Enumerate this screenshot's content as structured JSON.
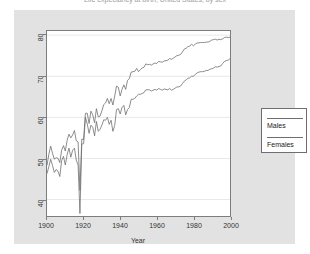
{
  "chart_title": "Life expectancy at birth, United States, by sex",
  "axes": {
    "x_label": "Year",
    "y_label": "",
    "x_ticks": [
      "1900",
      "1920",
      "1940",
      "1960",
      "1980",
      "2000"
    ],
    "y_ticks": [
      "40",
      "50",
      "60",
      "70",
      "80"
    ],
    "xlim": [
      1900,
      2000
    ],
    "ylim": [
      36,
      81
    ]
  },
  "legend": {
    "position": "right",
    "entries": [
      {
        "label": "Females",
        "color": "#6e6e6e"
      },
      {
        "label": "Males",
        "color": "#6e6e6e"
      }
    ],
    "items_top_to_bottom": [
      "Males",
      "Females"
    ]
  },
  "colors": {
    "panel_background": "#e2e2e2",
    "plot_background": "#ffffff",
    "grid": "#e8e8e8",
    "axis": "#7d7d7d",
    "line_female": "#6e6e6e",
    "line_male": "#6e6e6e",
    "text": "#333333"
  },
  "chart_data": {
    "type": "line",
    "title": "Life expectancy at birth, United States, by sex",
    "xlabel": "Year",
    "ylabel": "",
    "xlim": [
      1900,
      2000
    ],
    "ylim": [
      36,
      81
    ],
    "grid": true,
    "legend_position": "right",
    "x": [
      1900,
      1901,
      1902,
      1903,
      1904,
      1905,
      1906,
      1907,
      1908,
      1909,
      1910,
      1911,
      1912,
      1913,
      1914,
      1915,
      1916,
      1917,
      1918,
      1919,
      1920,
      1921,
      1922,
      1923,
      1924,
      1925,
      1926,
      1927,
      1928,
      1929,
      1930,
      1931,
      1932,
      1933,
      1934,
      1935,
      1936,
      1937,
      1938,
      1939,
      1940,
      1941,
      1942,
      1943,
      1944,
      1945,
      1946,
      1947,
      1948,
      1949,
      1950,
      1951,
      1952,
      1953,
      1954,
      1955,
      1956,
      1957,
      1958,
      1959,
      1960,
      1961,
      1962,
      1963,
      1964,
      1965,
      1966,
      1967,
      1968,
      1969,
      1970,
      1971,
      1972,
      1973,
      1974,
      1975,
      1976,
      1977,
      1978,
      1979,
      1980,
      1981,
      1982,
      1983,
      1984,
      1985,
      1986,
      1987,
      1988,
      1989,
      1990,
      1991,
      1992,
      1993,
      1994,
      1995,
      1996,
      1997,
      1998,
      1999,
      2000
    ],
    "series": [
      {
        "name": "Females",
        "values": [
          48.3,
          51.0,
          53.0,
          51.3,
          49.8,
          50.2,
          50.0,
          49.0,
          52.0,
          53.1,
          51.8,
          54.4,
          55.9,
          55.0,
          55.7,
          56.8,
          54.3,
          54.0,
          42.2,
          54.7,
          54.6,
          61.0,
          61.0,
          58.5,
          61.5,
          60.6,
          58.7,
          62.1,
          60.1,
          60.3,
          61.6,
          63.1,
          63.5,
          64.6,
          63.3,
          64.6,
          63.0,
          65.2,
          67.6,
          67.3,
          65.2,
          66.8,
          67.9,
          66.8,
          69.0,
          69.4,
          71.0,
          71.1,
          71.2,
          71.9,
          71.1,
          71.6,
          72.0,
          72.2,
          73.0,
          72.8,
          72.9,
          72.7,
          73.0,
          73.2,
          73.1,
          73.6,
          73.5,
          73.4,
          73.7,
          73.8,
          73.9,
          74.3,
          74.1,
          74.4,
          74.7,
          75.0,
          75.1,
          75.3,
          75.9,
          76.6,
          76.8,
          77.2,
          77.3,
          77.8,
          77.4,
          77.8,
          78.1,
          78.1,
          78.2,
          78.2,
          78.2,
          78.3,
          78.3,
          78.5,
          78.8,
          78.9,
          79.0,
          78.8,
          79.0,
          78.9,
          79.1,
          79.4,
          79.5,
          79.4,
          79.5
        ]
      },
      {
        "name": "Males",
        "values": [
          46.3,
          48.0,
          49.8,
          48.3,
          46.6,
          47.3,
          46.9,
          45.6,
          49.5,
          50.5,
          48.4,
          50.9,
          52.5,
          50.3,
          52.0,
          52.5,
          49.6,
          48.4,
          36.6,
          53.5,
          53.6,
          60.0,
          58.4,
          56.1,
          58.1,
          57.6,
          55.5,
          59.0,
          56.6,
          57.1,
          58.1,
          59.4,
          59.3,
          60.0,
          58.3,
          59.3,
          56.6,
          58.0,
          61.9,
          62.1,
          60.8,
          62.4,
          62.9,
          60.6,
          61.9,
          62.4,
          64.4,
          64.4,
          64.6,
          65.2,
          65.6,
          65.6,
          65.8,
          66.0,
          66.7,
          66.7,
          66.7,
          66.4,
          66.6,
          66.8,
          66.6,
          67.0,
          66.8,
          66.6,
          66.9,
          66.8,
          66.7,
          67.0,
          66.6,
          66.8,
          67.1,
          67.4,
          67.4,
          67.6,
          68.2,
          68.8,
          69.1,
          69.5,
          69.6,
          70.0,
          70.0,
          70.4,
          70.8,
          71.0,
          71.1,
          71.1,
          71.2,
          71.4,
          71.4,
          71.7,
          71.8,
          72.0,
          72.3,
          72.2,
          72.4,
          72.5,
          73.1,
          73.6,
          73.8,
          73.9,
          74.3
        ]
      }
    ]
  }
}
